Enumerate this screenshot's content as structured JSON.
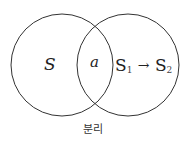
{
  "diagram": {
    "type": "venn",
    "left_circle": {
      "cx": 62,
      "cy": 65,
      "r": 51,
      "label": "S"
    },
    "right_circle": {
      "cx": 128,
      "cy": 65,
      "r": 51
    },
    "intersection_label": "a",
    "right_label": {
      "first": "S",
      "first_sub": "1",
      "arrow": "→",
      "second": "S",
      "second_sub": "2"
    },
    "caption": "분리",
    "stroke_color": "#333333"
  }
}
